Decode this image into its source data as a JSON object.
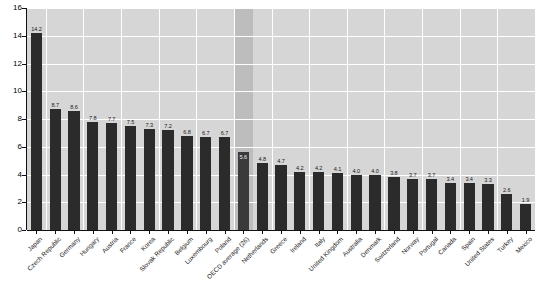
{
  "chart_data": {
    "type": "bar",
    "title": "",
    "xlabel": "",
    "ylabel": "",
    "ylim": [
      0,
      16
    ],
    "ytick_step": 2,
    "yticks": [
      "0",
      "2",
      "4",
      "6",
      "8",
      "10",
      "12",
      "14",
      "16"
    ],
    "grid": true,
    "legend": "none",
    "highlight_category": "OECD average (26)",
    "highlight_note": "OECD average column is drawn on a darker shaded background band",
    "categories": [
      "Japan",
      "Czech Republic",
      "Germany",
      "Hungary",
      "Austria",
      "France",
      "Korea",
      "Slovak Republic",
      "Belgium",
      "Luxembourg",
      "Poland",
      "OECD average (26)",
      "Netherlands",
      "Greece",
      "Ireland",
      "Italy",
      "United Kingdom",
      "Australia",
      "Denmark",
      "Switzerland",
      "Norway",
      "Portugal",
      "Canada",
      "Spain",
      "United States",
      "Turkey",
      "Mexico"
    ],
    "values": [
      14.2,
      8.7,
      8.6,
      7.8,
      7.7,
      7.5,
      7.3,
      7.2,
      6.8,
      6.7,
      6.7,
      5.6,
      4.8,
      4.7,
      4.2,
      4.2,
      4.1,
      4.0,
      4.0,
      3.8,
      3.7,
      3.7,
      3.4,
      3.4,
      3.3,
      2.6,
      1.9
    ],
    "value_labels": [
      "14.2",
      "8.7",
      "8.6",
      "7.8",
      "7.7",
      "7.5",
      "7.3",
      "7.2",
      "6.8",
      "6.7",
      "6.7",
      "5.6",
      "4.8",
      "4.7",
      "4.2",
      "4.2",
      "4.1",
      "4.0",
      "4.0",
      "3.8",
      "3.7",
      "3.7",
      "3.4",
      "3.4",
      "3.3",
      "2.6",
      "1.9"
    ]
  },
  "colors": {
    "plot_background": "#d6d6d6",
    "shade_band": "#bdbdbd",
    "gridline": "#ffffff",
    "bar": "#2b2b2b",
    "axis": "#111111",
    "tick_label": "#000000",
    "value_label": "#1a1a1a",
    "value_label_on_bar": "#f0f0f0",
    "page_background": "#ffffff"
  }
}
